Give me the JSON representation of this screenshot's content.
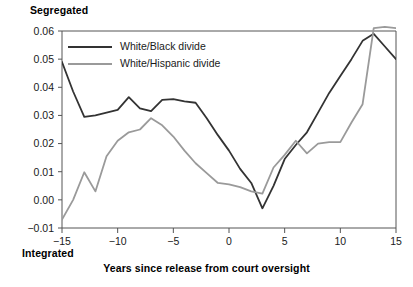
{
  "chart_data": {
    "type": "line",
    "title": "",
    "xlabel": "Years since release from court oversight",
    "ylabel": "",
    "y_top_label": "Segregated",
    "y_bottom_label": "Integrated",
    "xlim": [
      -15,
      15
    ],
    "ylim": [
      -0.01,
      0.06
    ],
    "grid": false,
    "legend_position": "top-left-inside",
    "x_ticks": [
      -15,
      -10,
      -5,
      0,
      5,
      10,
      15
    ],
    "x_tick_labels": [
      "−15",
      "−10",
      "−5",
      "0",
      "5",
      "10",
      "15"
    ],
    "y_ticks": [
      -0.01,
      0.0,
      0.01,
      0.02,
      0.03,
      0.04,
      0.05,
      0.06
    ],
    "y_tick_labels": [
      "−0.01",
      "0.00",
      "0.01",
      "0.02",
      "0.03",
      "0.04",
      "0.05",
      "0.06"
    ],
    "x": [
      -15,
      -14,
      -13,
      -12,
      -11,
      -10,
      -9,
      -8,
      -7,
      -6,
      -5,
      -4,
      -3,
      -2,
      -1,
      0,
      1,
      2,
      3,
      4,
      5,
      6,
      7,
      8,
      9,
      10,
      11,
      12,
      13,
      14,
      15
    ],
    "series": [
      {
        "name": "White/Black divide",
        "color": "#333333",
        "width": 1.8,
        "values": [
          0.049,
          0.0385,
          0.0295,
          0.03,
          0.031,
          0.032,
          0.0365,
          0.0325,
          0.0315,
          0.0355,
          0.0358,
          0.035,
          0.0345,
          0.029,
          0.023,
          0.0175,
          0.011,
          0.006,
          -0.003,
          0.005,
          0.0145,
          0.0195,
          0.024,
          0.031,
          0.038,
          0.044,
          0.05,
          0.0565,
          0.059,
          0.0545,
          0.05
        ]
      },
      {
        "name": "White/Hispanic divide",
        "color": "#9a9a9a",
        "width": 1.8,
        "values": [
          -0.007,
          0.0,
          0.0098,
          0.003,
          0.0155,
          0.021,
          0.024,
          0.025,
          0.029,
          0.0265,
          0.0225,
          0.0175,
          0.013,
          0.0095,
          0.006,
          0.0055,
          0.0045,
          0.003,
          0.0022,
          0.0115,
          0.016,
          0.021,
          0.0165,
          0.02,
          0.0205,
          0.0205,
          0.0275,
          0.034,
          0.061,
          0.0615,
          0.061
        ]
      }
    ]
  },
  "legend": {
    "entries": [
      {
        "label": "White/Black divide",
        "color": "#333333"
      },
      {
        "label": "White/Hispanic divide",
        "color": "#9a9a9a"
      }
    ]
  }
}
